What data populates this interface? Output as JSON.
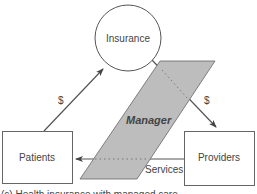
{
  "diagram": {
    "nodes": {
      "insurance": "Insurance",
      "patients": "Patients",
      "providers": "Providers",
      "manager": "Manager"
    },
    "edges": {
      "patients_to_insurance": "$",
      "insurance_to_providers": "$",
      "providers_to_patients": "Services"
    },
    "caption": "(c) Health insurance with managed care"
  },
  "colors": {
    "stroke": "#555555",
    "manager_fill": "#bdbdbd",
    "text": "#444444"
  }
}
